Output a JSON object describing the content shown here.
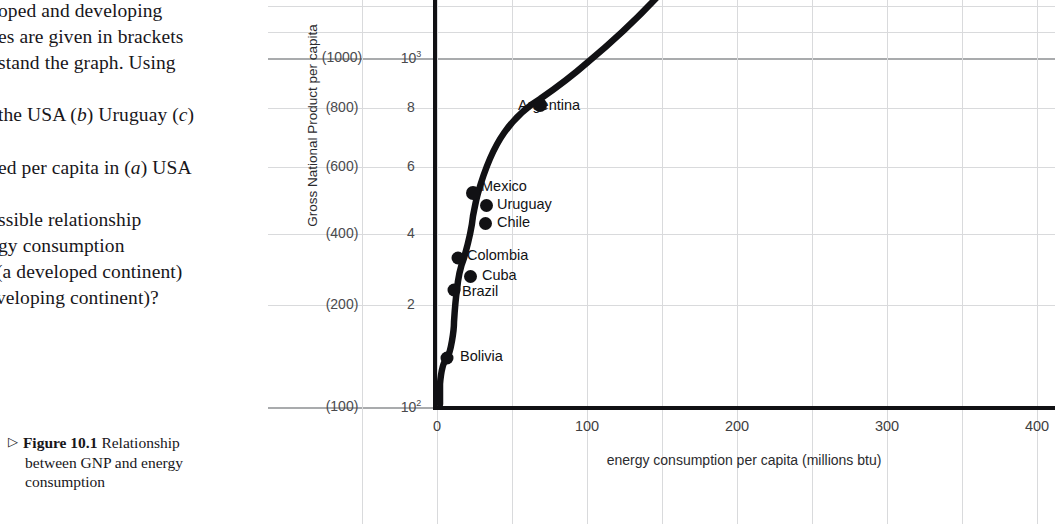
{
  "text_column": {
    "body_lines": [
      {
        "text": "oped and developing",
        "top": 0,
        "left": -2
      },
      {
        "text": "es are given in brackets",
        "top": 26,
        "left": -2
      },
      {
        "text": "stand the graph. Using",
        "top": 52,
        "left": -2
      },
      {
        "text": "the USA (b) Uruguay (c)",
        "top": 104,
        "left": -2,
        "italic_tokens": [
          "b",
          "c"
        ]
      },
      {
        "text": "ed per capita in (a) USA",
        "top": 157,
        "left": -2,
        "italic_tokens": [
          "a"
        ]
      },
      {
        "text": "ssible relationship",
        "top": 209,
        "left": -2
      },
      {
        "text": "gy consumption",
        "top": 235,
        "left": -2
      },
      {
        "text": "(a developed continent)",
        "top": 261,
        "left": -2
      },
      {
        "text": "veloping continent)?",
        "top": 287,
        "left": -2
      }
    ],
    "caption": {
      "triangle": "▷",
      "figure_number": "Figure 10.1",
      "line1_rest": "Relationship",
      "line2": "between GNP and energy",
      "line3": "consumption"
    }
  },
  "chart_data": {
    "type": "line",
    "title": "Relationship between GNP and energy consumption",
    "xlabel": "energy consumption per capita (millions btu)",
    "ylabel": "Gross National Product per capita",
    "xlim": [
      0,
      420
    ],
    "x_ticks": [
      "0",
      "100",
      "200",
      "300",
      "400"
    ],
    "x_tick_values": [
      0,
      100,
      200,
      300,
      400
    ],
    "x_gridline_step": 50,
    "y_scale": "log",
    "y_ticks_power": [
      "10³",
      "8",
      "6",
      "4",
      "2",
      "10²"
    ],
    "y_ticks_brackets": [
      "(1000)",
      "(800)",
      "(600)",
      "(400)",
      "(200)",
      "(100)"
    ],
    "y_tick_values": [
      1000,
      800,
      600,
      400,
      200,
      100
    ],
    "grid": true,
    "legend": "none",
    "series": [
      {
        "name": "GNP vs energy consumption curve",
        "marker": "filled-circle",
        "points": [
          {
            "label": "Bolivia",
            "x": 7,
            "y": 150
          },
          {
            "label": "Brazil",
            "x": 12,
            "y": 260
          },
          {
            "label": "Colombia",
            "x": 14,
            "y": 320
          },
          {
            "label": "Mexico",
            "x": 25,
            "y": 530
          },
          {
            "label": "Argentina",
            "x": 41,
            "y": 800
          }
        ]
      }
    ],
    "unconnected_points": [
      {
        "label": "Uruguay",
        "x": 34,
        "y": 470
      },
      {
        "label": "Chile",
        "x": 33,
        "y": 410
      },
      {
        "label": "Cuba",
        "x": 24,
        "y": 290
      }
    ],
    "annotations": [
      {
        "text": "Argentina",
        "at": "Argentina point"
      },
      {
        "text": "Mexico",
        "at": "Mexico point"
      },
      {
        "text": "Uruguay",
        "at": "Uruguay point"
      },
      {
        "text": "Chile",
        "at": "Chile point"
      },
      {
        "text": "Colombia",
        "at": "Colombia point"
      },
      {
        "text": "Cuba",
        "at": "Cuba point"
      },
      {
        "text": "Brazil",
        "at": "Brazil point"
      },
      {
        "text": "Bolivia",
        "at": "Bolivia point"
      }
    ]
  },
  "colors": {
    "curve": "#111114",
    "axis": "#111114",
    "grid": "#d9dadc",
    "grid_strong": "#a9abad",
    "text": "#18161a",
    "background": "#ffffff"
  }
}
